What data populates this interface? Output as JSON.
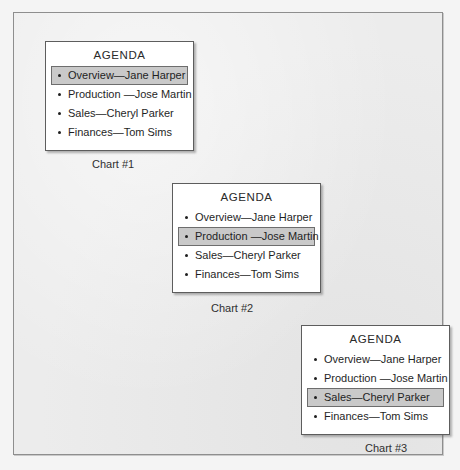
{
  "slide": {
    "background_color": "#ececec",
    "frame_color": "#8e8e8e"
  },
  "charts": [
    {
      "id": "chart-1",
      "title": "AGENDA",
      "caption": "Chart #1",
      "selected_index": 0,
      "items": [
        "Overview—Jane Harper",
        "Production —Jose Martin",
        "Sales—Cheryl Parker",
        "Finances—Tom Sims"
      ]
    },
    {
      "id": "chart-2",
      "title": "AGENDA",
      "caption": "Chart #2",
      "selected_index": 1,
      "items": [
        "Overview—Jane Harper",
        "Production —Jose Martin",
        "Sales—Cheryl Parker",
        "Finances—Tom Sims"
      ]
    },
    {
      "id": "chart-3",
      "title": "AGENDA",
      "caption": "Chart #3",
      "selected_index": 2,
      "items": [
        "Overview—Jane Harper",
        "Production —Jose Martin",
        "Sales—Cheryl Parker",
        "Finances—Tom Sims"
      ]
    }
  ],
  "highlight": {
    "fill_color": "#c9c9c9",
    "border_color": "#6d6d6d"
  }
}
